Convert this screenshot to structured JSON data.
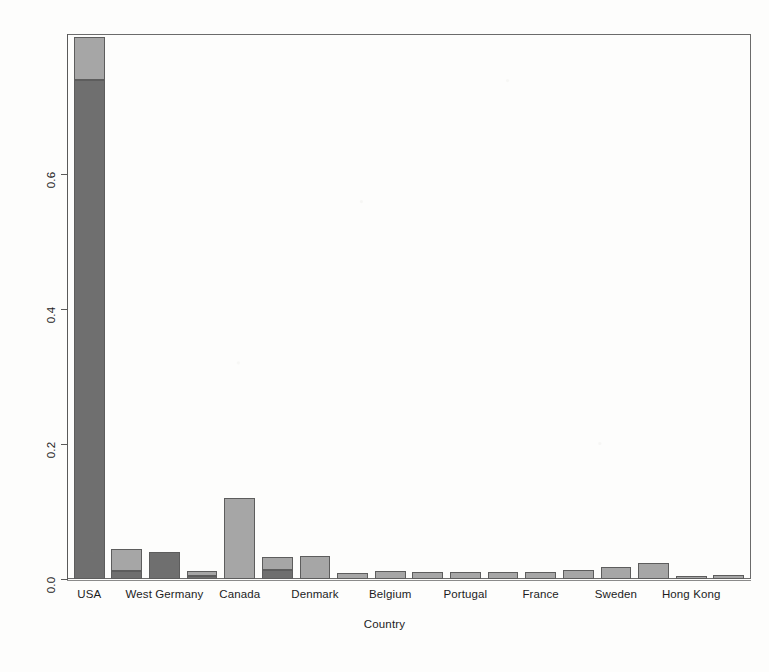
{
  "chart_data": {
    "type": "bar",
    "title": "",
    "subtitle": "",
    "xlabel": "Country",
    "ylabel": "",
    "stacked": true,
    "grid": false,
    "legend": "none",
    "ylim": [
      0.0,
      0.807
    ],
    "ytick_labels": [
      "0.0",
      "0.2",
      "0.4",
      "0.6"
    ],
    "ytick_values": [
      0.0,
      0.2,
      0.4,
      0.6
    ],
    "xtick_labels": [
      "USA",
      "West Germany",
      "Canada",
      "Denmark",
      "Belgium",
      "Portugal",
      "France",
      "Sweden",
      "Hong Kong"
    ],
    "categories": [
      "USA",
      "",
      "West Germany",
      "",
      "Canada",
      "",
      "Denmark",
      "",
      "Belgium",
      "",
      "Portugal",
      "",
      "France",
      "",
      "Sweden",
      "",
      "Hong Kong",
      ""
    ],
    "series": [
      {
        "name": "lower-segment",
        "color": "#6f6f6f",
        "values": [
          0.739,
          0.012,
          0.04,
          0.004,
          0.0,
          0.014,
          0.0,
          0.0,
          0.0,
          0.0,
          0.0,
          0.0,
          0.0,
          0.0,
          0.0,
          0.0,
          0.0,
          0.0
        ]
      },
      {
        "name": "upper-segment",
        "color": "#a6a6a6",
        "values": [
          0.063,
          0.033,
          0.0,
          0.008,
          0.12,
          0.018,
          0.034,
          0.009,
          0.012,
          0.01,
          0.01,
          0.01,
          0.011,
          0.013,
          0.018,
          0.024,
          0.005,
          0.006
        ]
      }
    ],
    "totals": [
      0.802,
      0.045,
      0.04,
      0.012,
      0.12,
      0.032,
      0.034,
      0.009,
      0.012,
      0.01,
      0.01,
      0.01,
      0.011,
      0.013,
      0.018,
      0.024,
      0.005,
      0.006
    ]
  },
  "colors": {
    "bar_dark": "#6f6f6f",
    "bar_light": "#a6a6a6",
    "bar_border": "#5d5d5d",
    "axis": "#5a5a5a",
    "frame": "#6b6b6b",
    "background": "#fdfdfc",
    "text": "#1c1c1c"
  }
}
